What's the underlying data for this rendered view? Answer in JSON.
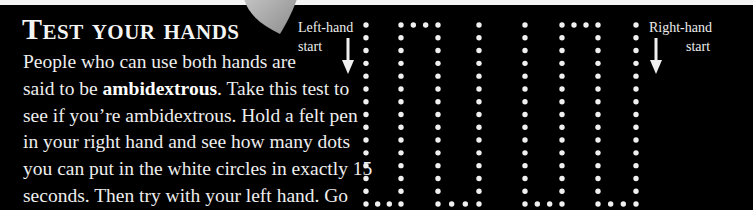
{
  "title": "Test your hands",
  "body": {
    "lines": [
      "People who can use both hands are",
      "said to be ",
      "see if you’re ambidextrous. Hold a felt pen",
      "in your right hand and see how many dots",
      "you can put in the white circles in exactly 15",
      "seconds. Then try with your left hand. Go",
      "to page 96 to see what your results mean."
    ],
    "line2_bold": "ambidextrous",
    "line2_tail": ". Take this test to"
  },
  "labels": {
    "left_line1": "Left-hand",
    "left_line2": "start",
    "right_line1": "Right-hand",
    "right_line2": "start"
  },
  "dot_maze": {
    "columns_x": [
      366,
      401,
      438,
      479,
      525,
      562,
      598,
      636
    ],
    "top_y": 25,
    "bottom_y": 204,
    "dot_spacing": 12.8,
    "dot_color": "#f0f0f0",
    "left_path": "start at column 1, down, across bottom, up, across top, down, across bottom, up to top of column 4",
    "right_path": "start at column 8, down, across bottom, up, across top, down, across bottom, up to top of column 5"
  },
  "colors": {
    "background": "#000000",
    "text": "#f0f0f0",
    "thumb": "#a8a8a8"
  }
}
